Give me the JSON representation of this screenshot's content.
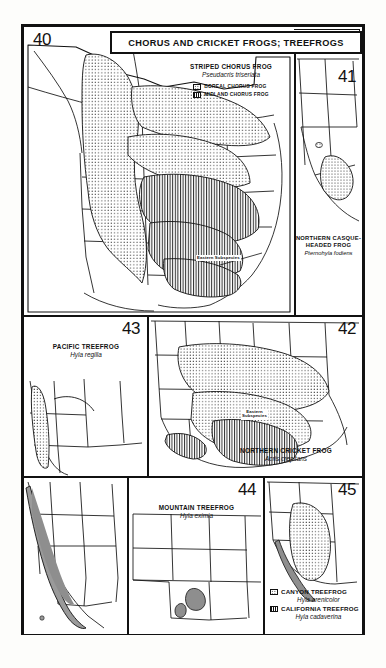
{
  "plate": {
    "title": "CHORUS AND CRICKET FROGS; TREEFROGS"
  },
  "panels": [
    {
      "id": "40",
      "number": "40",
      "common_name": "STRIPED CHORUS FROG",
      "scientific_name": "Pseudacris triseriata",
      "map_label": "Eastern Subspecies",
      "legend": [
        {
          "swatch": "dotted-pattern",
          "label": "BOREAL CHORUS FROG"
        },
        {
          "swatch": "vertical-hatch-pattern",
          "label": "MIDLAND CHORUS FROG"
        }
      ]
    },
    {
      "id": "41",
      "number": "41",
      "common_name_line1": "NORTHERN CASQUE-",
      "common_name_line2": "HEADED FROG",
      "scientific_name": "Pternohyla fodiens",
      "legend": []
    },
    {
      "id": "42",
      "number": "42",
      "common_name": "NORTHERN CRICKET FROG",
      "scientific_name": "Acris crepitans",
      "map_label_line1": "Eastern",
      "map_label_line2": "Subspecies",
      "legend": []
    },
    {
      "id": "43",
      "number": "43",
      "common_name": "PACIFIC TREEFROG",
      "scientific_name": "Hyla regilla",
      "legend": []
    },
    {
      "id": "44",
      "number": "44",
      "common_name": "MOUNTAIN TREEFROG",
      "scientific_name": "Hyla eximia",
      "legend": []
    },
    {
      "id": "45",
      "number": "45",
      "legend": [
        {
          "swatch": "dotted-pattern",
          "label": "CANYON TREEFROG",
          "scientific_name": "Hyla arenicolor"
        },
        {
          "swatch": "vertical-hatch-pattern",
          "label": "CALIFORNIA TREEFROG",
          "scientific_name": "Hyla cadaverina"
        }
      ]
    }
  ],
  "colors": {
    "ink": "#111111",
    "paper": "#ffffff",
    "page": "#fdfdfb",
    "range_fill": "#9a9a9a"
  }
}
